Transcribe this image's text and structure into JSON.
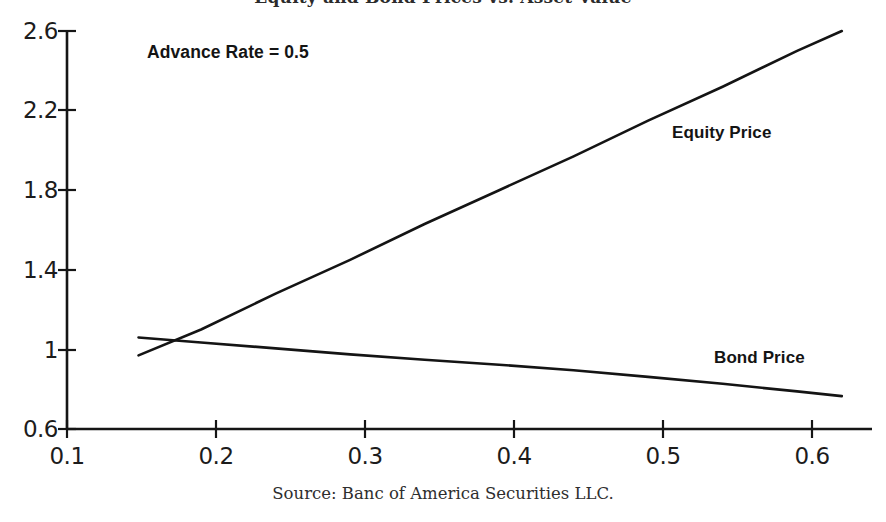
{
  "chart_data": {
    "type": "line",
    "title": "Equity and Bond Prices vs. Asset Value",
    "xlabel": "",
    "ylabel": "",
    "xlim": [
      0.1,
      0.65
    ],
    "ylim": [
      0.6,
      2.6
    ],
    "xticks": [
      "0.1",
      "0.2",
      "0.3",
      "0.4",
      "0.5",
      "0.6"
    ],
    "xtick_values": [
      0.1,
      0.2,
      0.3,
      0.4,
      0.5,
      0.6
    ],
    "yticks": [
      "0.6",
      "1",
      "1.4",
      "1.8",
      "2.2",
      "2.6"
    ],
    "ytick_values": [
      0.6,
      1.0,
      1.4,
      1.8,
      2.2,
      2.6
    ],
    "grid": false,
    "legend": "inline-labels",
    "annotations": [
      {
        "name": "advance-rate",
        "text": "Advance Rate = 0.5",
        "x": 0.135,
        "y": 2.52
      }
    ],
    "series": [
      {
        "name": "Equity Price",
        "label": "Equity Price",
        "color": "#141414",
        "label_position": {
          "x": 0.506,
          "y": 2.13
        },
        "x": [
          0.148,
          0.19,
          0.24,
          0.29,
          0.34,
          0.39,
          0.44,
          0.49,
          0.54,
          0.59,
          0.62
        ],
        "y": [
          0.97,
          1.1,
          1.28,
          1.45,
          1.63,
          1.8,
          1.97,
          2.15,
          2.32,
          2.5,
          2.6
        ]
      },
      {
        "name": "Bond Price",
        "label": "Bond Price",
        "color": "#141414",
        "label_position": {
          "x": 0.534,
          "y": 0.94
        },
        "x": [
          0.148,
          0.19,
          0.24,
          0.29,
          0.34,
          0.39,
          0.44,
          0.49,
          0.54,
          0.59,
          0.62
        ],
        "y": [
          1.06,
          1.035,
          1.005,
          0.975,
          0.948,
          0.923,
          0.895,
          0.862,
          0.827,
          0.789,
          0.765
        ]
      }
    ],
    "crossover_point": {
      "x": 0.181,
      "y": 1.04
    }
  },
  "source": {
    "caption": "Source: Banc of America Securities LLC."
  },
  "axes": {
    "y_labels": [
      "2.6",
      "2.2",
      "1.8",
      "1.4",
      "1",
      "0.6"
    ],
    "x_labels": [
      "0.1",
      "0.2",
      "0.3",
      "0.4",
      "0.5",
      "0.6"
    ]
  },
  "colors": {
    "line": "#141414",
    "axis": "#151515",
    "text": "#1c1c1c",
    "background": "#ffffff"
  }
}
